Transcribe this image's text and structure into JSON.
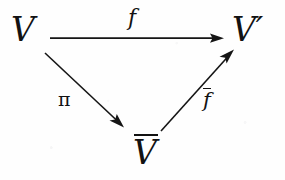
{
  "diagram": {
    "kind": "commutative-triangle",
    "background_color": "#fefefe",
    "ink_color": "#151515",
    "nodes": [
      {
        "id": "v",
        "label": "V",
        "overbar": false,
        "prime": false,
        "x": 27,
        "y": 30
      },
      {
        "id": "v-prime",
        "label": "V",
        "overbar": false,
        "prime": true,
        "x": 250,
        "y": 30
      },
      {
        "id": "v-bar",
        "label": "V",
        "overbar": true,
        "prime": false,
        "x": 148,
        "y": 155
      }
    ],
    "edges": [
      {
        "id": "f",
        "label": "f",
        "overbar": false,
        "from": "v",
        "to": "v-prime",
        "from_point": [
          50,
          38
        ],
        "to_point": [
          224,
          38
        ],
        "label_position": "above"
      },
      {
        "id": "pi",
        "label": "π",
        "overbar": false,
        "from": "v",
        "to": "v-bar",
        "from_point": [
          45,
          53
        ],
        "to_point": [
          125,
          128
        ],
        "label_position": "left"
      },
      {
        "id": "f-bar",
        "label": "f",
        "overbar": true,
        "from": "v-bar",
        "to": "v-prime",
        "from_point": [
          161,
          131
        ],
        "to_point": [
          234,
          50
        ],
        "label_position": "right"
      }
    ],
    "prime_glyph": "′"
  }
}
